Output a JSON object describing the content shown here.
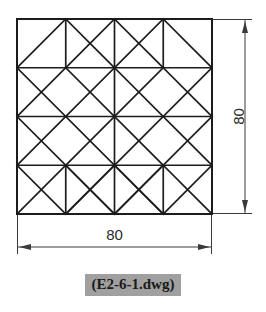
{
  "drawing": {
    "title_label": "(E2-6-1.dwg)",
    "line_color": "#1c1c1c",
    "dim_color": "#3a3a3a",
    "highlight_color": "#a0a0a0",
    "background_color": "#ffffff"
  },
  "dimensions": {
    "width": {
      "value": "80",
      "name": "bottom-width-dimension"
    },
    "height": {
      "value": "80",
      "name": "right-height-dimension"
    }
  },
  "geometry": {
    "shape": "square-quilt-star-pattern",
    "grid_divisions": 4,
    "side_units": 80,
    "corner_cells": "empty 2x2-unit squares at each corner"
  }
}
